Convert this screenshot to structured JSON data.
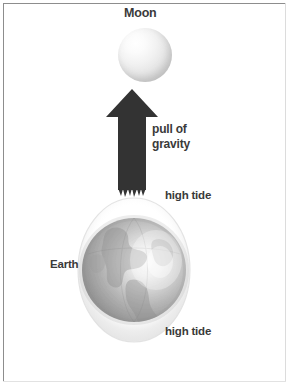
{
  "diagram": {
    "type": "science-illustration",
    "background_color": "#ffffff",
    "border_color": "#8d8d8d"
  },
  "labels": {
    "moon": "Moon",
    "earth": "Earth",
    "pull_of_gravity": "pull of\ngravity",
    "pull_of_gravity_line1": "pull of",
    "pull_of_gravity_line2": "gravity",
    "high_tide_top": "high tide",
    "high_tide_bottom": "high tide"
  },
  "elements": {
    "moon_body": {
      "name": "moon-sphere",
      "shape": "circle",
      "fill": "#e8e8e8",
      "highlight": "#ffffff"
    },
    "earth_body": {
      "name": "earth-globe",
      "shape": "circle",
      "fill": "#b4b4b4",
      "highlight": "#f4f4f4",
      "continents_visible": "Americas"
    },
    "tidal_bulge": {
      "name": "tidal-bulge-ellipse",
      "shape": "ellipse",
      "fill": "#f3f3f3",
      "description": "water envelope elongated toward and away from the Moon"
    },
    "gravity_arrow": {
      "name": "gravity-arrow",
      "direction": "up",
      "fill": "#333333",
      "points_to": "Moon",
      "tail_style": "ragged"
    }
  },
  "colors": {
    "text": "#3a3a3a",
    "arrow": "#333333",
    "frame": "#8d8d8d",
    "moon_light": "#ffffff",
    "moon_dark": "#c0c0c0",
    "earth_light": "#f4f4f4",
    "earth_dark": "#9a9a9a"
  }
}
